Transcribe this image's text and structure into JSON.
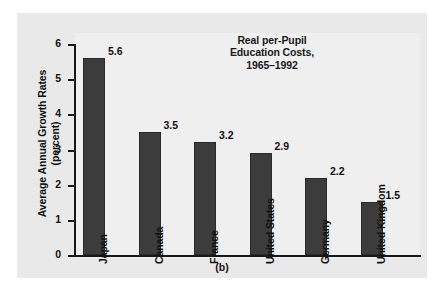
{
  "figure": {
    "caption": "(b)",
    "panel_color": "#e9e9e9",
    "plot_color": "#efefef",
    "bar_color": "#3c3c3c",
    "axis_color": "#181818",
    "text_color": "#111111"
  },
  "chart_data": {
    "type": "bar",
    "title": "Real per-Pupil Education Costs, 1965–1992",
    "title_lines": [
      "Real per-Pupil",
      "Education Costs,",
      "1965–1992"
    ],
    "xlabel": "",
    "ylabel": "Average Annual Growth Rates (percent)",
    "ylabel_lines": [
      "Average Annual Growth Rates",
      "(percent)"
    ],
    "ylim": [
      0,
      6
    ],
    "ytick_labels": [
      "6",
      "5",
      "4",
      "3",
      "2",
      "1",
      "0"
    ],
    "yticks": [
      6,
      5,
      4,
      3,
      2,
      1,
      0
    ],
    "grid": false,
    "legend": null,
    "categories": [
      "Japan",
      "Canada",
      "France",
      "United States",
      "Germany",
      "United Kingdom"
    ],
    "values": [
      5.6,
      3.5,
      3.2,
      2.9,
      2.2,
      1.5
    ],
    "value_labels": [
      "5.6",
      "3.5",
      "3.2",
      "2.9",
      "2.2",
      "1.5"
    ]
  }
}
